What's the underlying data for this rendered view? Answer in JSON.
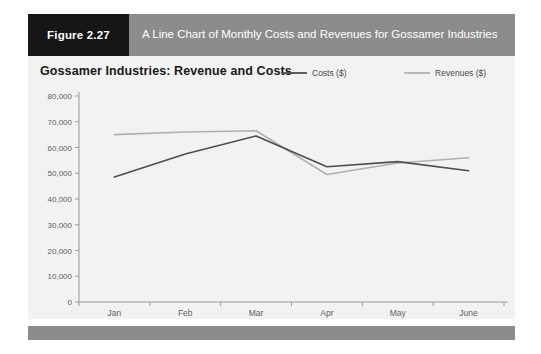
{
  "figure": {
    "badge_label": "Figure 2.27",
    "caption": "A Line Chart of Monthly Costs and Revenues for Gossamer Industries"
  },
  "chart_data": {
    "type": "line",
    "title": "Gossamer Industries: Revenue and Costs",
    "xlabel": "",
    "ylabel": "",
    "categories": [
      "Jan",
      "Feb",
      "Mar",
      "Apr",
      "May",
      "June"
    ],
    "series": [
      {
        "name": "Costs ($)",
        "color": "#4d4d4d",
        "values": [
          48500,
          57500,
          64500,
          52500,
          54500,
          51000
        ]
      },
      {
        "name": "Revenues ($)",
        "color": "#b0b0b0",
        "values": [
          65000,
          66000,
          66500,
          49500,
          54000,
          56000
        ]
      }
    ],
    "ylim": [
      0,
      80000
    ],
    "ytick_step": 10000,
    "ytick_labels": [
      "80,000",
      "70,000",
      "60,000",
      "50,000",
      "40,000",
      "30,000",
      "20,000",
      "10,000",
      "0"
    ],
    "grid": false,
    "legend_position": "top-right"
  },
  "colors": {
    "badge_background": "#161616",
    "caption_background": "#8c8c8c",
    "panel_background": "#f2f2f2",
    "footer_background": "#8c8c8c",
    "axis": "#9a9a9a",
    "costs_line": "#4d4d4d",
    "revenues_line": "#b0b0b0"
  }
}
